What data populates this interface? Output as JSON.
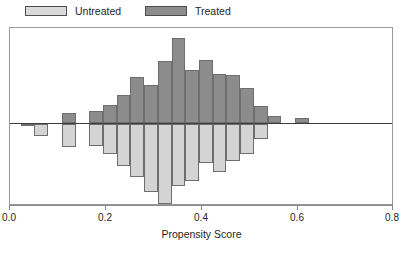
{
  "legend": {
    "entries": [
      {
        "label": "Untreated",
        "swatch_color": "#d9d9d9",
        "icon": "legend-swatch-untreated"
      },
      {
        "label": "Treated",
        "swatch_color": "#8c8c8c",
        "icon": "legend-swatch-treated"
      }
    ]
  },
  "axis": {
    "x_title": "Propensity Score",
    "x_ticks": [
      "0.0",
      "0.2",
      "0.4",
      "0.6",
      "0.8"
    ]
  },
  "colors": {
    "treated": "#8c8c8c",
    "untreated": "#d4d4d4",
    "bar_border": "#6e6e6e",
    "frame": "#9a9a9a",
    "zero_line": "#3c3c3c",
    "text": "#231f20"
  },
  "chart_data": {
    "type": "bar",
    "subtype": "back-to-back mirrored histogram",
    "title": "",
    "xlabel": "Propensity Score",
    "ylabel": "",
    "xlim": [
      0.0,
      0.8
    ],
    "xticks": [
      0.0,
      0.2,
      0.4,
      0.6,
      0.8
    ],
    "grid": false,
    "legend_position": "above-plot-left",
    "bin_width": 0.0286,
    "bin_centers": [
      0.043,
      0.071,
      0.1,
      0.129,
      0.157,
      0.186,
      0.214,
      0.243,
      0.271,
      0.3,
      0.329,
      0.357,
      0.386,
      0.414,
      0.443,
      0.471,
      0.5,
      0.529,
      0.557,
      0.586,
      0.614,
      0.643
    ],
    "series": [
      {
        "name": "Treated",
        "direction": "up",
        "color": "#8c8c8c",
        "values": [
          0,
          0,
          0,
          0,
          2,
          2,
          0,
          6,
          6,
          0,
          12,
          12,
          22,
          22,
          36,
          36,
          62,
          62,
          46,
          46,
          80,
          80,
          52,
          52,
          44,
          44,
          34,
          34,
          20,
          8,
          6
        ]
      },
      {
        "name": "Untreated",
        "direction": "down",
        "color": "#d4d4d4",
        "values": [
          2,
          2,
          16,
          16,
          0,
          30,
          30,
          0,
          34,
          34,
          52,
          52,
          64,
          64,
          86,
          86,
          64,
          64,
          100,
          100,
          70,
          70,
          58,
          58,
          40,
          40,
          30,
          30,
          0,
          0,
          0
        ]
      }
    ],
    "bars": [
      {
        "x0": 0.023,
        "x1": 0.051,
        "treated": 0,
        "untreated": 2
      },
      {
        "x0": 0.051,
        "x1": 0.08,
        "treated": 0,
        "untreated": 16
      },
      {
        "x0": 0.08,
        "x1": 0.108,
        "treated": 0,
        "untreated": 0
      },
      {
        "x0": 0.108,
        "x1": 0.137,
        "treated": 12,
        "untreated": 30
      },
      {
        "x0": 0.137,
        "x1": 0.165,
        "treated": 0,
        "untreated": 0
      },
      {
        "x0": 0.165,
        "x1": 0.194,
        "treated": 14,
        "untreated": 28
      },
      {
        "x0": 0.194,
        "x1": 0.223,
        "treated": 21,
        "untreated": 38
      },
      {
        "x0": 0.223,
        "x1": 0.251,
        "treated": 33,
        "untreated": 54
      },
      {
        "x0": 0.251,
        "x1": 0.28,
        "treated": 54,
        "untreated": 68
      },
      {
        "x0": 0.28,
        "x1": 0.308,
        "treated": 44,
        "untreated": 88
      },
      {
        "x0": 0.308,
        "x1": 0.337,
        "treated": 72,
        "untreated": 103
      },
      {
        "x0": 0.337,
        "x1": 0.365,
        "treated": 100,
        "untreated": 80
      },
      {
        "x0": 0.365,
        "x1": 0.394,
        "treated": 62,
        "untreated": 74
      },
      {
        "x0": 0.394,
        "x1": 0.422,
        "treated": 74,
        "untreated": 50
      },
      {
        "x0": 0.422,
        "x1": 0.451,
        "treated": 57,
        "untreated": 62
      },
      {
        "x0": 0.451,
        "x1": 0.48,
        "treated": 56,
        "untreated": 47
      },
      {
        "x0": 0.48,
        "x1": 0.508,
        "treated": 41,
        "untreated": 38
      },
      {
        "x0": 0.508,
        "x1": 0.537,
        "treated": 20,
        "untreated": 19
      },
      {
        "x0": 0.537,
        "x1": 0.565,
        "treated": 8,
        "untreated": 0
      },
      {
        "x0": 0.565,
        "x1": 0.594,
        "treated": 0,
        "untreated": 0
      },
      {
        "x0": 0.594,
        "x1": 0.623,
        "treated": 6,
        "untreated": 0
      }
    ]
  }
}
